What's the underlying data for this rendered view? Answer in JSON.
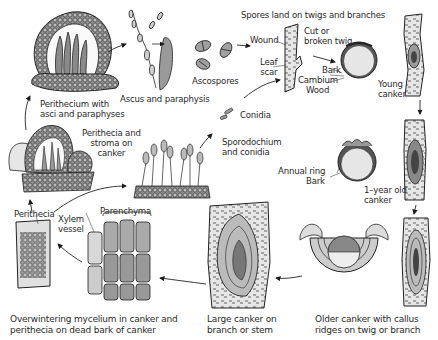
{
  "diagram": {
    "stages": [
      {
        "id": "perithecium",
        "label": "Perithecium with\nasci and paraphyses"
      },
      {
        "id": "ascus",
        "label": "Ascus and paraphysis"
      },
      {
        "id": "ascospores",
        "label": "Ascospores"
      },
      {
        "id": "spores-land",
        "label": "Spores land on twigs and branches"
      },
      {
        "id": "wound",
        "label": "Wound"
      },
      {
        "id": "leaf-scar",
        "label": "Leaf\nscar"
      },
      {
        "id": "cut-twig",
        "label": "Cut or\nbroken twig"
      },
      {
        "id": "bark",
        "label": "Bark"
      },
      {
        "id": "cambium",
        "label": "Cambium"
      },
      {
        "id": "wood",
        "label": "Wood"
      },
      {
        "id": "young-canker",
        "label": "Young\ncanker"
      },
      {
        "id": "conidia",
        "label": "Conidia"
      },
      {
        "id": "sporodochium",
        "label": "Sporodochium\nand conidia"
      },
      {
        "id": "perithecia-stroma",
        "label": "Perithecia and\nstroma on\ncanker"
      },
      {
        "id": "annual-ring",
        "label": "Annual ring"
      },
      {
        "id": "bark2",
        "label": "Bark"
      },
      {
        "id": "one-year-canker",
        "label": "1–year old\ncanker"
      },
      {
        "id": "perithecia",
        "label": "Perithecia"
      },
      {
        "id": "xylem",
        "label": "Xylem\nvessel"
      },
      {
        "id": "parenchyma",
        "label": "Parenchyma"
      },
      {
        "id": "overwintering",
        "label": "Overwintering mycelium in canker and\nperithecia on dead bark of canker"
      },
      {
        "id": "large-canker",
        "label": "Large canker on\nbranch or stem"
      },
      {
        "id": "older-canker",
        "label": "Older canker with callus\nridges on twig or branch"
      }
    ],
    "colors": {
      "line": "#1a1a1a",
      "fill_light": "#d9d9d9",
      "fill_mid": "#a8a8a8",
      "fill_dark": "#555555",
      "background": "#ffffff"
    }
  }
}
